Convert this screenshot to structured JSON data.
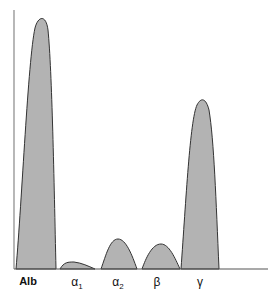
{
  "diagram": {
    "fill_color": "#b3b3b3",
    "stroke_color": "#333333",
    "fractions": [
      {
        "id": "alb",
        "label": "Alb",
        "sub": "",
        "x": 28
      },
      {
        "id": "alpha1",
        "label": "α",
        "sub": "1",
        "x": 77
      },
      {
        "id": "alpha2",
        "label": "α",
        "sub": "2",
        "x": 118
      },
      {
        "id": "beta",
        "label": "β",
        "sub": "",
        "x": 157
      },
      {
        "id": "gamma",
        "label": "γ",
        "sub": "",
        "x": 200
      }
    ]
  }
}
